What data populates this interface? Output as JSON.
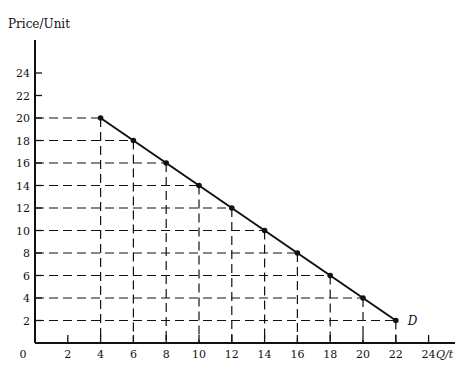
{
  "chart_data": {
    "type": "line",
    "title": "",
    "ylabel": "Price/Unit",
    "xlabel": "Q/t",
    "origin_label": "0",
    "curve_label": "D",
    "x_ticks": [
      2,
      4,
      6,
      8,
      10,
      12,
      14,
      16,
      18,
      20,
      22,
      24
    ],
    "y_ticks": [
      2,
      4,
      6,
      8,
      10,
      12,
      14,
      16,
      18,
      20,
      22,
      24
    ],
    "xlim": [
      0,
      25.5
    ],
    "ylim": [
      0,
      27
    ],
    "grid": "dashed projection lines from each point to axes",
    "series": [
      {
        "name": "D",
        "x": [
          4,
          6,
          8,
          10,
          12,
          14,
          16,
          18,
          20,
          22
        ],
        "y": [
          20,
          18,
          16,
          14,
          12,
          10,
          8,
          6,
          4,
          2
        ]
      }
    ]
  },
  "colors": {
    "ink": "#111111",
    "background": "#ffffff"
  }
}
